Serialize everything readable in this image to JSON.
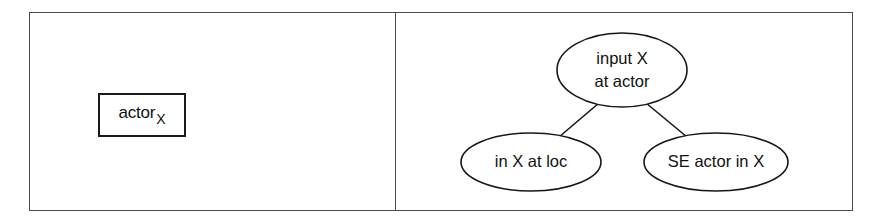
{
  "figure": {
    "background_color": "#ffffff",
    "frame_color": "#4a4a4a",
    "stroke_color": "#171717",
    "text_color": "#111111"
  },
  "left_panel": {
    "box": {
      "base_label": "actor",
      "subscript_label": "X"
    }
  },
  "right_panel": {
    "graph": {
      "nodes": [
        {
          "id": "root",
          "shape": "ellipse",
          "lines": [
            "input X",
            "at actor"
          ],
          "cx": 226,
          "cy": 57,
          "rx": 65,
          "ry": 37
        },
        {
          "id": "left-child",
          "shape": "ellipse",
          "lines": [
            "in X at loc"
          ],
          "cx": 135,
          "cy": 149,
          "rx": 70,
          "ry": 29
        },
        {
          "id": "right-child",
          "shape": "ellipse",
          "lines": [
            "SE actor in X"
          ],
          "cx": 320,
          "cy": 149,
          "rx": 72,
          "ry": 29
        }
      ],
      "edges": [
        {
          "id": "root-to-left",
          "from": "root",
          "to": "left-child",
          "x1": 203,
          "y1": 90,
          "x2": 163,
          "y2": 124
        },
        {
          "id": "root-to-right",
          "from": "root",
          "to": "right-child",
          "x1": 250,
          "y1": 90,
          "x2": 291,
          "y2": 124
        }
      ]
    }
  }
}
